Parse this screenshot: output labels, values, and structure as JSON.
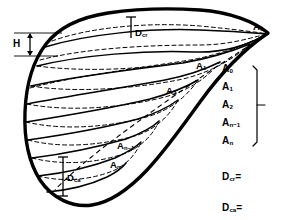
{
  "figure": {
    "type": "anatomical-volume-diagram",
    "background_color": "#ffffff",
    "line_color": "#000000",
    "labels": {
      "height_measure": "H",
      "diameter_cranial": "D",
      "diameter_cranial_sub": "cr",
      "diameter_caudal": "D",
      "diameter_caudal_sub": "ca",
      "area_base": "A",
      "area_sub_0": "0",
      "area_sub_1": "1",
      "area_sub_2": "2",
      "area_sub_nminus1": "n−1",
      "area_sub_n": "n"
    },
    "outline_labels": [
      {
        "name": "A0",
        "base": "A",
        "sub": "0",
        "x": 255,
        "y": 27
      },
      {
        "name": "A1",
        "base": "A",
        "sub": "1",
        "x": 196,
        "y": 66
      },
      {
        "name": "A2",
        "base": "A",
        "sub": "2",
        "x": 166,
        "y": 91
      },
      {
        "name": "An-1",
        "base": "A",
        "sub": "n−1",
        "x": 117,
        "y": 146
      },
      {
        "name": "An",
        "base": "A",
        "sub": "n",
        "x": 110,
        "y": 164
      }
    ],
    "legend_list": [
      {
        "name": "A0",
        "base": "A",
        "sub": "0"
      },
      {
        "name": "A1",
        "base": "A",
        "sub": "1"
      },
      {
        "name": "A2",
        "base": "A",
        "sub": "2"
      },
      {
        "name": "An-1",
        "base": "A",
        "sub": "n−1"
      },
      {
        "name": "An",
        "base": "A",
        "sub": "n"
      }
    ],
    "equations": [
      {
        "name": "D-cr-equation",
        "base": "D",
        "sub": "cr",
        "op": "="
      },
      {
        "name": "D-ca-equation",
        "base": "D",
        "sub": "ca",
        "op": "="
      }
    ],
    "inner_measures": [
      {
        "name": "D-cr-measure",
        "base": "D",
        "sub": "cr"
      },
      {
        "name": "D-ca-measure",
        "base": "D",
        "sub": "ca"
      }
    ]
  }
}
